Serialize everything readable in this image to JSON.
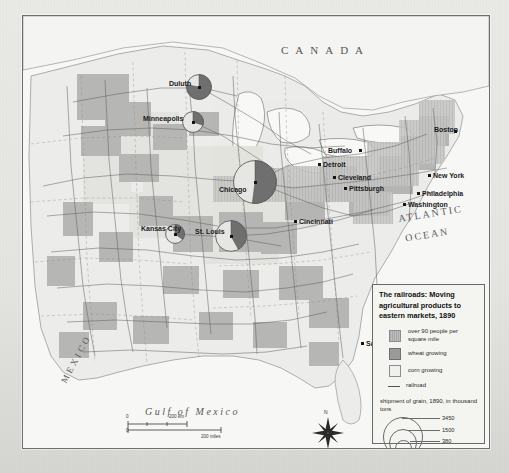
{
  "map": {
    "title": "The railroads: Moving agricultural products to eastern markets, 1890",
    "countries": [
      {
        "name": "CANADA",
        "display": "CANADA"
      },
      {
        "name": "MEXICO",
        "display": "MEXICO"
      }
    ],
    "water_labels": [
      {
        "name": "ATLANTIC",
        "display": "ATLANTIC"
      },
      {
        "name": "OCEAN",
        "display": "OCEAN"
      },
      {
        "name": "Gulf of Mexico",
        "display": "Gulf of Mexico"
      }
    ],
    "cities": [
      {
        "name": "Duluth",
        "label": "Duluth",
        "x": 176,
        "y": 71,
        "lx": 146,
        "ly": 64,
        "circle": 13,
        "wheat_pct": 78
      },
      {
        "name": "Minneapolis",
        "label": "Minneapolis",
        "x": 170,
        "y": 106,
        "lx": 120,
        "ly": 99,
        "circle": 11,
        "wheat_pct": 30
      },
      {
        "name": "Chicago",
        "label": "Chicago",
        "x": 232,
        "y": 166,
        "lx": 196,
        "ly": 170,
        "circle": 22,
        "wheat_pct": 52
      },
      {
        "name": "Detroit",
        "label": "Detroit",
        "x": 296,
        "y": 148,
        "lx": 300,
        "ly": 145,
        "circle": 0,
        "wheat_pct": 0
      },
      {
        "name": "Buffalo",
        "label": "Buffalo",
        "x": 337,
        "y": 134,
        "lx": 305,
        "ly": 131,
        "circle": 0,
        "wheat_pct": 0
      },
      {
        "name": "Cleveland",
        "label": "Cleveland",
        "x": 311,
        "y": 161,
        "lx": 315,
        "ly": 158,
        "circle": 0,
        "wheat_pct": 0
      },
      {
        "name": "Pittsburgh",
        "label": "Pittsburgh",
        "x": 322,
        "y": 172,
        "lx": 326,
        "ly": 169,
        "circle": 0,
        "wheat_pct": 0
      },
      {
        "name": "Boston",
        "label": "Boston",
        "x": 432,
        "y": 115,
        "lx": 411,
        "ly": 110,
        "circle": 0,
        "wheat_pct": 0
      },
      {
        "name": "New York",
        "label": "New York",
        "x": 406,
        "y": 159,
        "lx": 410,
        "ly": 156,
        "circle": 0,
        "wheat_pct": 0
      },
      {
        "name": "Philadelphia",
        "label": "Philadelphia",
        "x": 395,
        "y": 177,
        "lx": 399,
        "ly": 174,
        "circle": 0,
        "wheat_pct": 0
      },
      {
        "name": "Washington",
        "label": "Washington",
        "x": 381,
        "y": 188,
        "lx": 385,
        "ly": 185,
        "circle": 0,
        "wheat_pct": 0
      },
      {
        "name": "Kansas City",
        "label": "Kansas City",
        "x": 152,
        "y": 218,
        "lx": 118,
        "ly": 209,
        "circle": 10,
        "wheat_pct": 35
      },
      {
        "name": "St. Louis",
        "label": "St. Louis",
        "x": 208,
        "y": 220,
        "lx": 172,
        "ly": 212,
        "circle": 16,
        "wheat_pct": 42
      },
      {
        "name": "Cincinnati",
        "label": "Cincinnati",
        "x": 272,
        "y": 205,
        "lx": 276,
        "ly": 202,
        "circle": 0,
        "wheat_pct": 0
      },
      {
        "name": "Savannah",
        "label": "Savannah",
        "x": 339,
        "y": 327,
        "lx": 343,
        "ly": 324,
        "circle": 0,
        "wheat_pct": 0
      }
    ],
    "compass": {
      "north_label": "N"
    },
    "scale": {
      "km_value": "200 km",
      "miles_value": "200 miles",
      "zero_top": "0",
      "zero_bottom": "0"
    }
  },
  "legend": {
    "title": "The railroads: Moving agricultural products to eastern markets, 1890",
    "entries": [
      {
        "name": "population-density",
        "label": "over 90 people per square mile",
        "swatch": "sw-pop"
      },
      {
        "name": "wheat-growing",
        "label": "wheat growing",
        "swatch": "sw-wheat"
      },
      {
        "name": "corn-growing",
        "label": "corn growing",
        "swatch": "sw-corn"
      },
      {
        "name": "railroad",
        "label": "railroad",
        "swatch": "line"
      }
    ],
    "shipment_caption": "shipment of grain, 1890, in thousand tons",
    "shipment_circles": [
      {
        "name": "large",
        "value": "3450",
        "d": 38
      },
      {
        "name": "medium",
        "value": "1500",
        "d": 26
      },
      {
        "name": "small",
        "value": "380",
        "d": 15
      }
    ],
    "crop_key": [
      {
        "name": "wheat",
        "label": "wheat",
        "swatch": "bsw-wheat"
      },
      {
        "name": "corn",
        "label": "corn",
        "swatch": "bsw-corn"
      }
    ]
  },
  "colors": {
    "wheat": "#6f6f6f",
    "corn": "#e6e6e3",
    "population": "#bdbdbd",
    "railroad": "#555555",
    "land": "#ececea",
    "ocean": "#f7f7f5"
  }
}
